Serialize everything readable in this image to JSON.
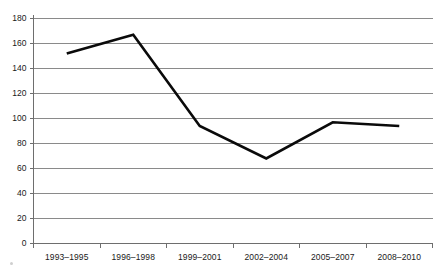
{
  "chart_data": {
    "type": "line",
    "title": "",
    "subtitle": "",
    "xlabel": "",
    "ylabel": "",
    "categories": [
      "1993–1995",
      "1996–1998",
      "1999–2001",
      "2002–2004",
      "2005–2007",
      "2008–2010"
    ],
    "series": [
      {
        "name": "",
        "values": [
          152,
          167,
          94,
          68,
          97,
          94
        ]
      }
    ],
    "ylim": [
      0,
      180
    ],
    "yticks": [
      0,
      20,
      40,
      60,
      80,
      100,
      120,
      140,
      160,
      180
    ],
    "ytick_labels": [
      "0",
      "20",
      "40",
      "60",
      "80",
      "100",
      "120",
      "140",
      "160",
      "180"
    ],
    "grid": true,
    "grid_axis": "y",
    "legend": false,
    "legend_position": "none",
    "colors": {
      "line": "#0a0a0a",
      "grid": "#8a8a8a",
      "axis": "#6e6e6e",
      "text": "#1a1a1a",
      "background": "#ffffff"
    }
  }
}
